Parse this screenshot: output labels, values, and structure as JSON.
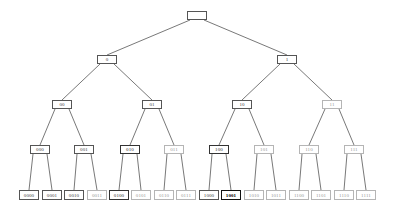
{
  "diagram": {
    "type": "binary-tree",
    "depth": 4,
    "edge_color": "#555555",
    "style_colors": {
      "normal": "#555555",
      "light": "#b5b5b5",
      "dark": "#333333",
      "bold": "#111111"
    },
    "nodes": [
      {
        "id": "root",
        "label": "",
        "x": 187,
        "y": 11,
        "w": 20,
        "h": 9,
        "style": "normal"
      },
      {
        "id": "0",
        "label": "0",
        "x": 97,
        "y": 55,
        "w": 20,
        "h": 9,
        "style": "normal",
        "parent": "root"
      },
      {
        "id": "1",
        "label": "1",
        "x": 277,
        "y": 55,
        "w": 20,
        "h": 9,
        "style": "normal",
        "parent": "root"
      },
      {
        "id": "00",
        "label": "00",
        "x": 52,
        "y": 100,
        "w": 20,
        "h": 9,
        "style": "normal",
        "parent": "0"
      },
      {
        "id": "01",
        "label": "01",
        "x": 142,
        "y": 100,
        "w": 20,
        "h": 9,
        "style": "normal",
        "parent": "0"
      },
      {
        "id": "10",
        "label": "10",
        "x": 232,
        "y": 100,
        "w": 20,
        "h": 9,
        "style": "normal",
        "parent": "1"
      },
      {
        "id": "11",
        "label": "11",
        "x": 322,
        "y": 100,
        "w": 20,
        "h": 9,
        "style": "light",
        "parent": "1"
      },
      {
        "id": "000",
        "label": "000",
        "x": 30,
        "y": 145,
        "w": 20,
        "h": 9,
        "style": "normal",
        "parent": "00"
      },
      {
        "id": "001",
        "label": "001",
        "x": 74,
        "y": 145,
        "w": 20,
        "h": 9,
        "style": "normal",
        "parent": "00"
      },
      {
        "id": "010",
        "label": "010",
        "x": 120,
        "y": 145,
        "w": 20,
        "h": 9,
        "style": "dark",
        "parent": "01"
      },
      {
        "id": "011",
        "label": "011",
        "x": 164,
        "y": 145,
        "w": 20,
        "h": 9,
        "style": "light",
        "parent": "01"
      },
      {
        "id": "100",
        "label": "100",
        "x": 209,
        "y": 145,
        "w": 20,
        "h": 9,
        "style": "dark",
        "parent": "10"
      },
      {
        "id": "101",
        "label": "101",
        "x": 254,
        "y": 145,
        "w": 20,
        "h": 9,
        "style": "light",
        "parent": "10"
      },
      {
        "id": "110",
        "label": "110",
        "x": 299,
        "y": 145,
        "w": 20,
        "h": 9,
        "style": "light",
        "parent": "11"
      },
      {
        "id": "111",
        "label": "111",
        "x": 344,
        "y": 145,
        "w": 20,
        "h": 9,
        "style": "light",
        "parent": "11"
      },
      {
        "id": "0000",
        "label": "0000",
        "x": 19,
        "y": 190,
        "w": 20,
        "h": 10,
        "style": "normal",
        "parent": "000"
      },
      {
        "id": "0001",
        "label": "0001",
        "x": 42,
        "y": 190,
        "w": 20,
        "h": 10,
        "style": "normal",
        "parent": "000"
      },
      {
        "id": "0010",
        "label": "0010",
        "x": 64,
        "y": 190,
        "w": 20,
        "h": 10,
        "style": "normal",
        "parent": "001"
      },
      {
        "id": "0011",
        "label": "0011",
        "x": 87,
        "y": 190,
        "w": 20,
        "h": 10,
        "style": "light",
        "parent": "001"
      },
      {
        "id": "0100",
        "label": "0100",
        "x": 109,
        "y": 190,
        "w": 20,
        "h": 10,
        "style": "dark",
        "parent": "010"
      },
      {
        "id": "0101",
        "label": "0101",
        "x": 131,
        "y": 190,
        "w": 20,
        "h": 10,
        "style": "light",
        "parent": "010"
      },
      {
        "id": "0110",
        "label": "0110",
        "x": 154,
        "y": 190,
        "w": 20,
        "h": 10,
        "style": "light",
        "parent": "011"
      },
      {
        "id": "0111",
        "label": "0111",
        "x": 176,
        "y": 190,
        "w": 20,
        "h": 10,
        "style": "light",
        "parent": "011"
      },
      {
        "id": "1000",
        "label": "1000",
        "x": 199,
        "y": 190,
        "w": 20,
        "h": 10,
        "style": "normal",
        "parent": "100"
      },
      {
        "id": "1001",
        "label": "1001",
        "x": 221,
        "y": 190,
        "w": 20,
        "h": 10,
        "style": "bold",
        "parent": "100"
      },
      {
        "id": "1010",
        "label": "1010",
        "x": 244,
        "y": 190,
        "w": 20,
        "h": 10,
        "style": "light",
        "parent": "101"
      },
      {
        "id": "1011",
        "label": "1011",
        "x": 266,
        "y": 190,
        "w": 20,
        "h": 10,
        "style": "light",
        "parent": "101"
      },
      {
        "id": "1100",
        "label": "1100",
        "x": 289,
        "y": 190,
        "w": 20,
        "h": 10,
        "style": "light",
        "parent": "110"
      },
      {
        "id": "1101",
        "label": "1101",
        "x": 311,
        "y": 190,
        "w": 20,
        "h": 10,
        "style": "light",
        "parent": "110"
      },
      {
        "id": "1110",
        "label": "1110",
        "x": 334,
        "y": 190,
        "w": 20,
        "h": 10,
        "style": "light",
        "parent": "111"
      },
      {
        "id": "1111",
        "label": "1111",
        "x": 356,
        "y": 190,
        "w": 20,
        "h": 10,
        "style": "light",
        "parent": "111"
      }
    ]
  }
}
